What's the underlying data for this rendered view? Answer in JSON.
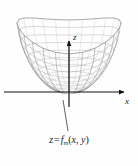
{
  "figure": {
    "name": "surface-plot-figure",
    "background_color": "#fefefe",
    "axes": {
      "x": {
        "label": "x",
        "direction": "right"
      },
      "y": {
        "label": "",
        "direction": "left-front"
      },
      "z": {
        "label": "z",
        "direction": "up"
      }
    },
    "caption": {
      "full_text": "z = f_m(x, y)",
      "lhs": "z",
      "equals": "=",
      "function_name": "f",
      "subscript": "m",
      "open_paren": "(",
      "arg1": "x",
      "comma": ",",
      "arg2": "y",
      "close_paren": ")"
    },
    "surface": {
      "description": "wireframe mesh bowl-shaped surface with scalloped rim",
      "mesh_color": "#8a8a8a",
      "mesh_color_dark": "#5e5e5e",
      "axis_color": "#111111",
      "leader_line_color": "#3a3a3a"
    }
  },
  "chart_data": {
    "type": "surface",
    "title": "",
    "xlabel": "x",
    "ylabel": "y",
    "zlabel": "z",
    "surface_label": "z = f_m(x, y)",
    "grid": true,
    "legend": false,
    "u_divisions": 24,
    "v_divisions": 12,
    "radial_extent": 1.0,
    "height_range": [
      0,
      1
    ],
    "ring_radii": [
      0.18,
      0.3,
      0.42,
      0.53,
      0.63,
      0.72,
      0.8,
      0.87,
      0.93,
      0.97,
      1.0
    ],
    "ring_heights": [
      0.02,
      0.06,
      0.12,
      0.2,
      0.29,
      0.39,
      0.5,
      0.62,
      0.74,
      0.87,
      1.0
    ],
    "scallop_amplitude": 0.07,
    "scallop_lobes": 2
  }
}
